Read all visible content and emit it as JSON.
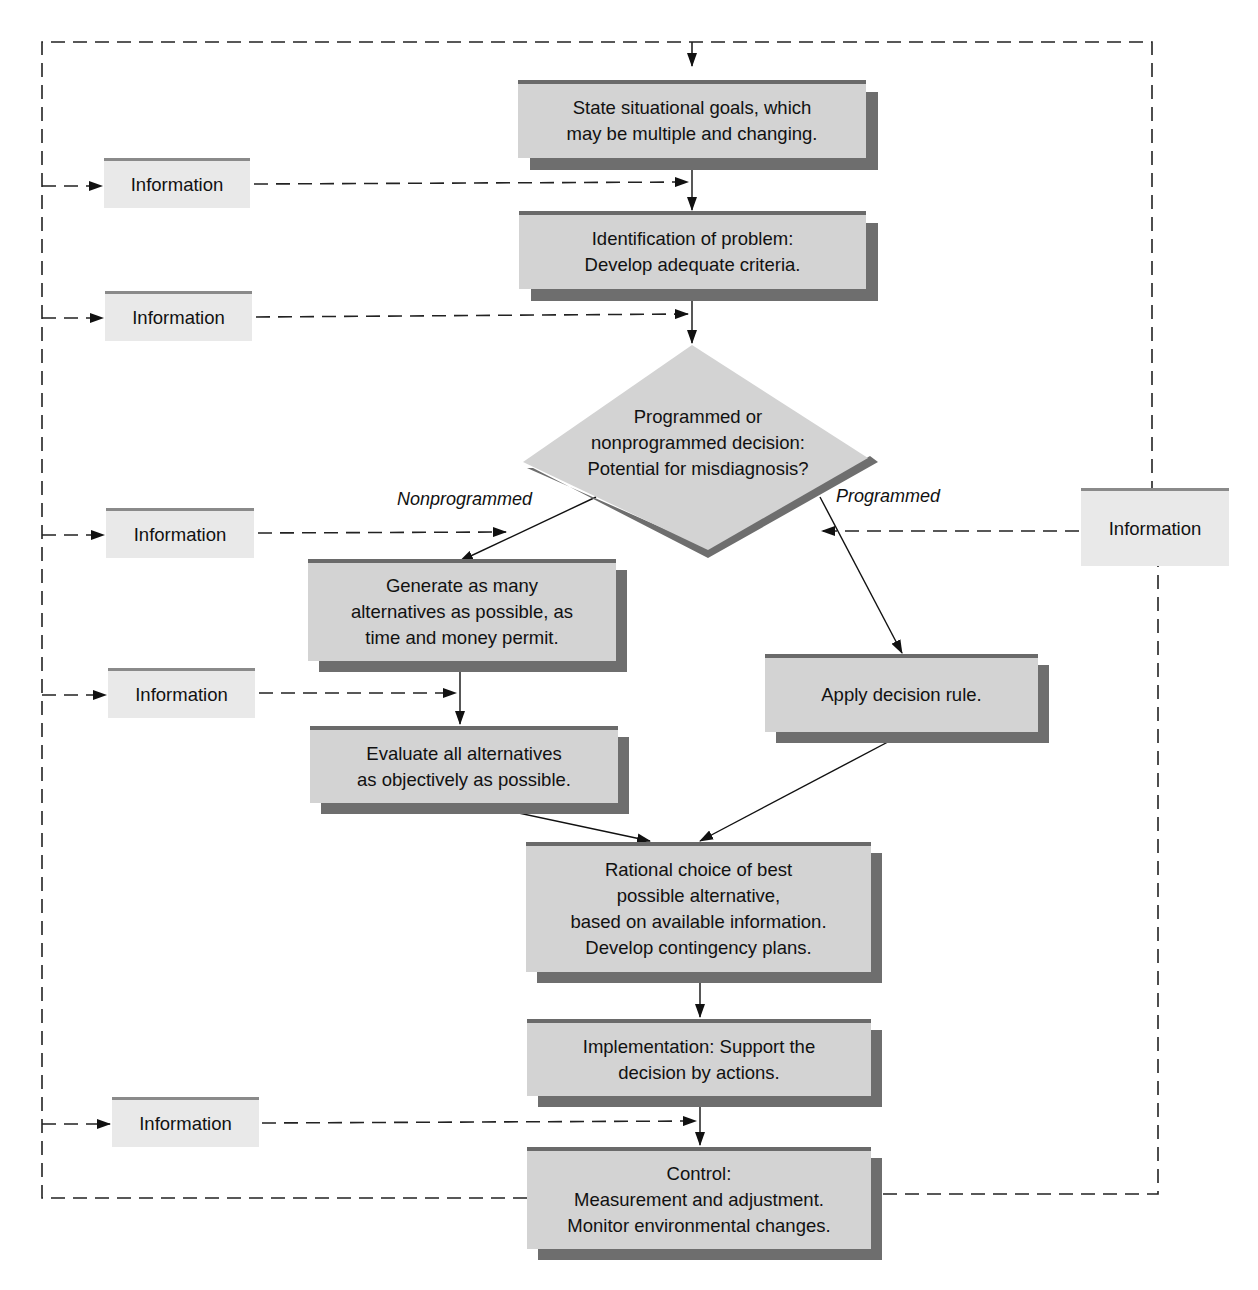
{
  "diagram": {
    "type": "flowchart",
    "colors": {
      "box_fill": "#d3d3d3",
      "box_top_rule": "#6a6a6a",
      "box_shadow": "#6e6e6e",
      "info_fill": "#e9e9e9",
      "info_top_rule": "#8a8a8a",
      "line": "#111111"
    },
    "steps": [
      {
        "id": "goals",
        "lines": [
          "State situational goals, which",
          "may be multiple and changing."
        ]
      },
      {
        "id": "problem",
        "lines": [
          "Identification of problem:",
          "Develop adequate criteria."
        ]
      },
      {
        "id": "decision",
        "shape": "diamond",
        "lines": [
          "Programmed or",
          "nonprogrammed decision:",
          "Potential for misdiagnosis?"
        ]
      },
      {
        "id": "generate",
        "lines": [
          "Generate as many",
          "alternatives as possible, as",
          "time and money permit."
        ]
      },
      {
        "id": "evaluate",
        "lines": [
          "Evaluate all alternatives",
          "as objectively as possible."
        ]
      },
      {
        "id": "apply",
        "lines": [
          "Apply decision rule."
        ]
      },
      {
        "id": "choice",
        "lines": [
          "Rational choice of best",
          "possible alternative,",
          "based on available information.",
          "Develop contingency plans."
        ]
      },
      {
        "id": "implementation",
        "lines": [
          "Implementation: Support the",
          "decision by actions."
        ]
      },
      {
        "id": "control",
        "lines": [
          "Control:",
          "Measurement and adjustment.",
          "Monitor environmental changes."
        ]
      }
    ],
    "branches": {
      "nonprogrammed": "Nonprogrammed",
      "programmed": "Programmed"
    },
    "info_boxes": [
      {
        "label": "Information",
        "feeds": "problem"
      },
      {
        "label": "Information",
        "feeds": "decision"
      },
      {
        "label": "Information",
        "feeds": "generate"
      },
      {
        "label": "Information",
        "feeds": "evaluate"
      },
      {
        "label": "Information",
        "feeds": "control"
      },
      {
        "label": "Information",
        "feeds": "apply"
      }
    ],
    "edges": [
      {
        "from": "goals",
        "to": "problem",
        "style": "solid"
      },
      {
        "from": "problem",
        "to": "decision",
        "style": "solid"
      },
      {
        "from": "decision",
        "to": "generate",
        "style": "solid",
        "label": "Nonprogrammed"
      },
      {
        "from": "decision",
        "to": "apply",
        "style": "solid",
        "label": "Programmed"
      },
      {
        "from": "generate",
        "to": "evaluate",
        "style": "solid"
      },
      {
        "from": "evaluate",
        "to": "choice",
        "style": "solid"
      },
      {
        "from": "apply",
        "to": "choice",
        "style": "solid"
      },
      {
        "from": "choice",
        "to": "implementation",
        "style": "solid"
      },
      {
        "from": "implementation",
        "to": "control",
        "style": "solid"
      },
      {
        "from": "control",
        "to": "goals",
        "style": "dashed",
        "note": "feedback loop"
      }
    ]
  }
}
